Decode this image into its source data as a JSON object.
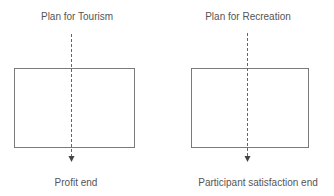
{
  "diagram": {
    "colors": {
      "text": "#555555",
      "box_stroke": "#7a7a7a",
      "dashed_line": "#666666"
    },
    "panels": [
      {
        "title": "Plan for Tourism",
        "end_label": "Profit end"
      },
      {
        "title": "Plan for Recreation",
        "end_label": "Participant satisfaction end"
      }
    ]
  }
}
